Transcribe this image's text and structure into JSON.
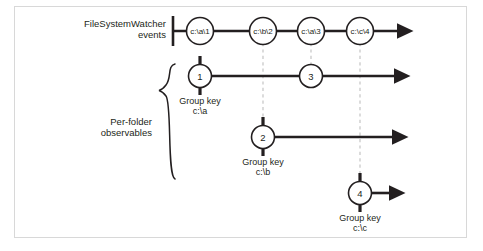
{
  "figure": {
    "title_row_label": "FileSystemWatcher\nevents",
    "bracket_label": "Per-folder\nobservables",
    "group_key_caption": "Group key"
  },
  "event_timeline": {
    "name": "FileSystemWatcher events",
    "events": [
      {
        "label": "c:\\a\\1",
        "x": 200,
        "y": 31
      },
      {
        "label": "c:\\b\\2",
        "x": 263,
        "y": 31
      },
      {
        "label": "c:\\a\\3",
        "x": 311,
        "y": 31
      },
      {
        "label": "c:\\c\\4",
        "x": 360,
        "y": 31
      }
    ],
    "axis": {
      "start_x": 173,
      "end_x": 408,
      "y": 31
    }
  },
  "observables": [
    {
      "group_key": "c:\\a",
      "group_key_label": "Group key",
      "row_y": 76,
      "axis_start_x": 186,
      "axis_end_x": 405,
      "nodes": [
        {
          "label": "1",
          "x": 200,
          "y": 76,
          "source_event": "c:\\a\\1",
          "connector": "solid"
        },
        {
          "label": "3",
          "x": 311,
          "y": 76,
          "source_event": "c:\\a\\3",
          "connector": "dashed"
        }
      ],
      "caption_x": 200,
      "caption_y": 98
    },
    {
      "group_key": "c:\\b",
      "group_key_label": "Group key",
      "row_y": 137,
      "axis_start_x": 249,
      "axis_end_x": 403,
      "nodes": [
        {
          "label": "2",
          "x": 263,
          "y": 137,
          "source_event": "c:\\b\\2",
          "connector": "dashed"
        }
      ],
      "caption_x": 263,
      "caption_y": 159
    },
    {
      "group_key": "c:\\c",
      "group_key_label": "Group key",
      "row_y": 193,
      "axis_start_x": 346,
      "axis_end_x": 400,
      "nodes": [
        {
          "label": "4",
          "x": 360,
          "y": 193,
          "source_event": "c:\\c\\4",
          "connector": "dashed"
        }
      ],
      "caption_x": 360,
      "caption_y": 215
    }
  ],
  "colors": {
    "ink": "#231f20",
    "dashed_guide": "#c9c9c9",
    "frame_border": "#d8d8d8",
    "background": "#ffffff"
  }
}
